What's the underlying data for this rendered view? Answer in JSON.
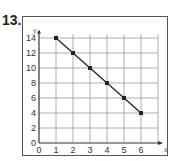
{
  "problem_number": "13.",
  "chart_data": {
    "type": "line",
    "title": "",
    "xlabel": "x",
    "ylabel": "y",
    "x": [
      1,
      2,
      3,
      4,
      5,
      6
    ],
    "series": [
      {
        "name": "line",
        "values": [
          14,
          12,
          10,
          8,
          6,
          4
        ],
        "markers": true
      }
    ],
    "xlim": [
      0,
      7
    ],
    "ylim": [
      0,
      15
    ],
    "x_ticks": [
      "0",
      "1",
      "2",
      "3",
      "4",
      "5",
      "6"
    ],
    "y_ticks": [
      "0",
      "2",
      "4",
      "6",
      "8",
      "10",
      "12",
      "14"
    ],
    "grid": true,
    "legend": "none"
  },
  "colors": {
    "line": "#222222",
    "grid": "#999999",
    "axis": "#333333"
  }
}
